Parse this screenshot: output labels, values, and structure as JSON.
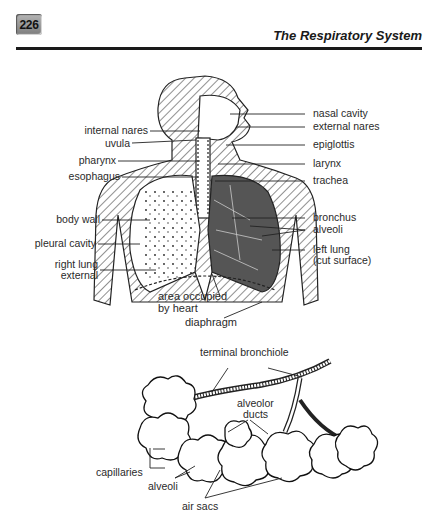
{
  "header": {
    "page_number": "226",
    "running_title": "The Respiratory System"
  },
  "figure1": {
    "labels_left": {
      "internal_nares": "internal nares",
      "uvula": "uvula",
      "pharynx": "pharynx",
      "esophagus": "esophagus",
      "body_wall": "body wall",
      "pleural_cavity": "pleural cavity",
      "right_lung_1": "right lung",
      "right_lung_2": "external"
    },
    "labels_right": {
      "nasal_cavity": "nasal cavity",
      "external_nares": "external nares",
      "epiglottis": "epiglottis",
      "larynx": "larynx",
      "trachea": "trachea",
      "bronchus": "bronchus",
      "alveoli": "alveoli",
      "left_lung_1": "left lung",
      "left_lung_2": "(cut surface)"
    },
    "labels_bottom": {
      "heart_1": "area occupied",
      "heart_2": "by heart",
      "diaphragm": "diaphragm"
    }
  },
  "figure2": {
    "terminal_bronchiole": "terminal bronchiole",
    "alveolor_ducts_1": "alveolor",
    "alveolor_ducts_2": "ducts",
    "capillaries": "capillaries",
    "alveoli": "alveoli",
    "air_sacs": "air sacs"
  }
}
